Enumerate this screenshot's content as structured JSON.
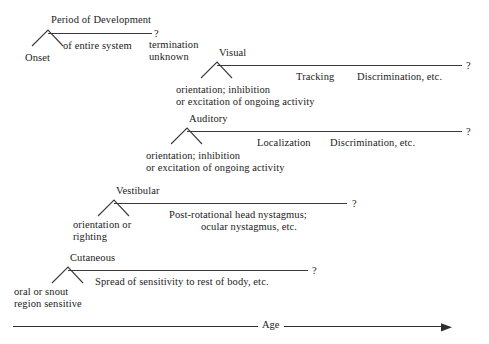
{
  "figure": {
    "type": "developmental-timeline-diagram",
    "background_color": "#ffffff",
    "line_color": "#3a3a3a",
    "text_color": "#1b1b1b",
    "axis": {
      "label": "Age",
      "direction": "left-to-right",
      "arrowhead": "right"
    },
    "uncertainty_marker": "?"
  },
  "rows": [
    {
      "id": "period-of-development",
      "title": "Period of Development",
      "onset_label": "Onset",
      "span_label": "of entire system",
      "end_marker": "?",
      "end_note_line1": "termination",
      "end_note_line2": "unknown",
      "milestones": []
    },
    {
      "id": "visual",
      "title": "Visual",
      "onset_line1": "orientation; inhibition",
      "onset_line2": "or excitation of ongoing activity",
      "end_marker": "?",
      "milestones": [
        "Tracking",
        "Discrimination, etc."
      ]
    },
    {
      "id": "auditory",
      "title": "Auditory",
      "onset_line1": "orientation; inhibition",
      "onset_line2": "or excitation of ongoing activity",
      "end_marker": "?",
      "milestones": [
        "Localization",
        "Discrimination, etc."
      ]
    },
    {
      "id": "vestibular",
      "title": "Vestibular",
      "onset_line1": "orientation or",
      "onset_line2": "righting",
      "end_marker": "?",
      "milestones": [
        "Post-rotational head nystagmus;",
        "ocular nystagmus, etc."
      ]
    },
    {
      "id": "cutaneous",
      "title": "Cutaneous",
      "onset_line1": "oral or snout",
      "onset_line2": "region sensitive",
      "end_marker": "?",
      "milestones": [
        "Spread of sensitivity to rest of body, etc."
      ]
    }
  ]
}
